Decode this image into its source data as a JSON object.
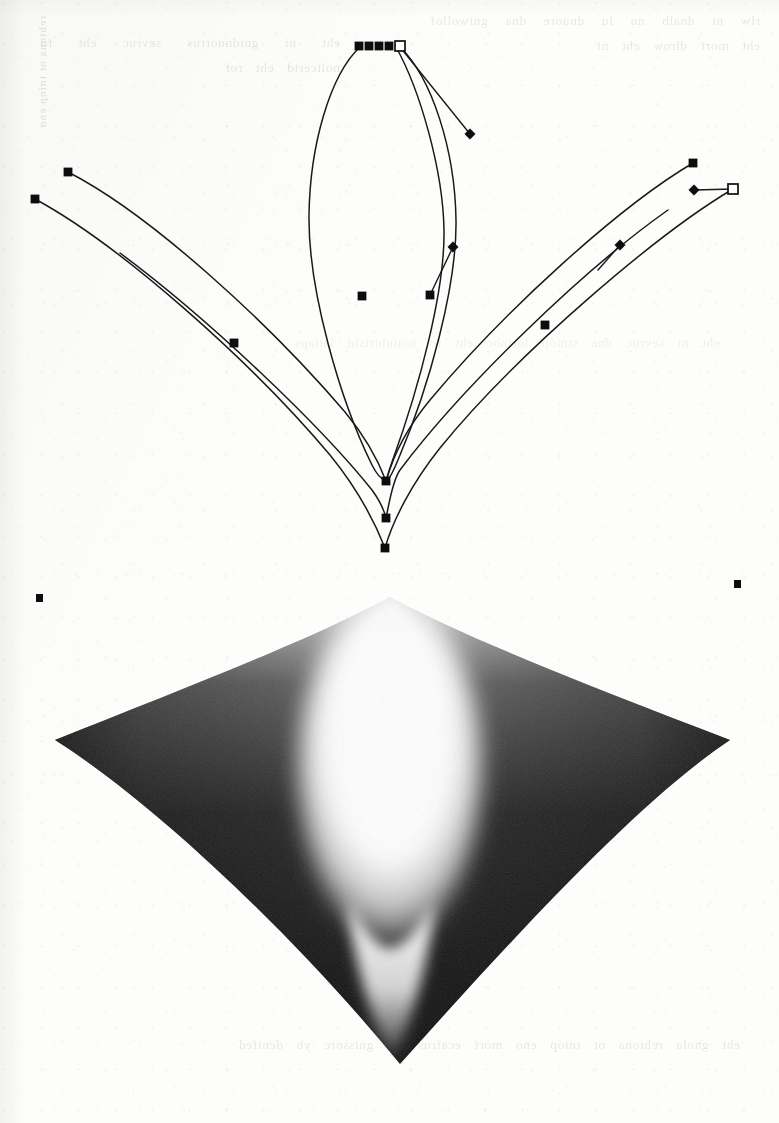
{
  "page": {
    "kind": "scanned-book-page",
    "width": 779,
    "height": 1123,
    "paper_color": "#fdfdfc",
    "ink_color": "#0d0d0d"
  },
  "ghost_text": {
    "note": "faint illegible bleed-through from the reverse side of the sheet",
    "top": "rlw ni dnalb nu lu dnuore dna gniwollof eht morf dlrow eht ni",
    "left": "eht ni gnidnuorrus sevruc eht fo noitcerid eht rof",
    "middle": "eht ni sevruc dna stniop lortnoc eht fo noitubirtsid laitaps",
    "bottom": "eht gnola rehtona ot tniop eno morf ecafrus eht gnissorc yb denifed"
  },
  "spine_text": "rehtona ot tniop eno",
  "curve_figure": {
    "name": "bezier-curve-control-diagram",
    "description": "Three branches of a cusp caustic drawn as outlined Bezier curves with visible anchor points, control nodes and tangent handles",
    "stroke_color": "#1a1a1a",
    "stroke_width": 1.5,
    "paths": [
      {
        "id": "left-outer",
        "d": "M 35 199 C 120 245 250 360 330 455 C 352 482 372 515 385 548"
      },
      {
        "id": "left-inner",
        "d": "M 68 172 C 150 214 268 322 345 412 C 364 435 378 460 386 481"
      },
      {
        "id": "center-left-lobe",
        "d": "M 360 47 C 330 75 310 145 309 215 C 308 290 340 400 372 465 C 378 477 383 480 386 481"
      },
      {
        "id": "center-right-lobe",
        "d": "M 400 47 C 432 78 455 150 456 220 C 457 285 430 385 398 460 C 393 472 389 479 387 481"
      },
      {
        "id": "center-inner-spike",
        "d": "M 396 47 C 420 90 443 170 444 230 C 445 290 420 385 392 462 C 389 471 387 478 386 481"
      },
      {
        "id": "right-inner",
        "d": "M 693 163 C 620 206 505 310 430 400 C 405 430 392 460 386 481"
      },
      {
        "id": "right-outer",
        "d": "M 733 189 C 660 232 520 350 440 448 C 412 483 393 520 385 548"
      },
      {
        "id": "middle-v-left",
        "d": "M 120 253 C 210 320 320 425 372 490 C 380 501 384 510 386 518"
      },
      {
        "id": "middle-v-right",
        "d": "M 668 210 C 580 272 460 390 400 470 C 392 481 388 510 386 518"
      }
    ],
    "handle_lines": [
      {
        "id": "top-right-handle",
        "x1": 400,
        "y1": 47,
        "x2": 470,
        "y2": 134
      },
      {
        "id": "mid-right-handle",
        "x1": 430,
        "y1": 295,
        "x2": 453,
        "y2": 247
      },
      {
        "id": "far-right-handle",
        "x1": 733,
        "y1": 189,
        "x2": 694,
        "y2": 190
      },
      {
        "id": "lower-right-handle",
        "x1": 598,
        "y1": 270,
        "x2": 620,
        "y2": 245
      }
    ],
    "nodes": [
      {
        "id": "anchor-top-1",
        "type": "filled-square",
        "x": 359,
        "y": 46
      },
      {
        "id": "anchor-top-2",
        "type": "filled-square",
        "x": 369,
        "y": 46
      },
      {
        "id": "anchor-top-3",
        "type": "filled-square",
        "x": 379,
        "y": 46
      },
      {
        "id": "anchor-top-4",
        "type": "filled-square",
        "x": 389,
        "y": 46
      },
      {
        "id": "anchor-top-selected",
        "type": "hollow-square",
        "x": 400,
        "y": 46
      },
      {
        "id": "handle-top-right",
        "type": "diamond",
        "x": 470,
        "y": 134
      },
      {
        "id": "anchor-left-upper",
        "type": "filled-square",
        "x": 68,
        "y": 172
      },
      {
        "id": "anchor-left-outer",
        "type": "filled-square",
        "x": 35,
        "y": 199
      },
      {
        "id": "anchor-left-mid",
        "type": "filled-square",
        "x": 234,
        "y": 343
      },
      {
        "id": "anchor-center-mid",
        "type": "filled-square",
        "x": 362,
        "y": 296
      },
      {
        "id": "anchor-center-right",
        "type": "filled-square",
        "x": 430,
        "y": 295
      },
      {
        "id": "handle-center-right",
        "type": "diamond",
        "x": 453,
        "y": 247
      },
      {
        "id": "anchor-right-upper",
        "type": "filled-square",
        "x": 693,
        "y": 163
      },
      {
        "id": "anchor-right-end",
        "type": "hollow-square",
        "x": 733,
        "y": 189
      },
      {
        "id": "handle-right-end",
        "type": "diamond",
        "x": 694,
        "y": 190
      },
      {
        "id": "handle-right-mid",
        "type": "diamond",
        "x": 620,
        "y": 245
      },
      {
        "id": "anchor-right-mid",
        "type": "filled-square",
        "x": 545,
        "y": 325
      },
      {
        "id": "cusp-node-upper",
        "type": "filled-square",
        "x": 386,
        "y": 481
      },
      {
        "id": "cusp-node-middle",
        "type": "filled-square",
        "x": 386,
        "y": 518
      },
      {
        "id": "cusp-node-lower",
        "type": "filled-square",
        "x": 385,
        "y": 548
      }
    ],
    "stray_dots": [
      {
        "id": "stray-dot-left",
        "x": 36,
        "y": 594,
        "w": 7,
        "h": 8
      },
      {
        "id": "stray-dot-right",
        "x": 734,
        "y": 580,
        "w": 7,
        "h": 8
      }
    ]
  },
  "gradient_figure": {
    "name": "cusp-caustic-intensity-plot",
    "description": "Kite-shaped region shaded with a grayscale intensity field: dark at the outer edges, a bright white caustic cusp running down the centre",
    "outline": "M 390 597 C 470 640 600 690 730 740 C 640 800 520 930 400 1064 C 290 930 150 800 55 740 C 185 688 315 638 390 597",
    "vertices": {
      "top": {
        "x": 390,
        "y": 597
      },
      "right": {
        "x": 730,
        "y": 740
      },
      "bottom": {
        "x": 400,
        "y": 1064
      },
      "left": {
        "x": 55,
        "y": 740
      }
    },
    "colors": {
      "darkest": "#111111",
      "mid": "#7a7a7a",
      "brightest": "#ffffff"
    },
    "caustic": {
      "left_branch": "M 390 600 C 350 700 318 820 352 940 C 368 1000 385 1040 398 1062",
      "right_branch": "M 390 600 C 432 700 466 820 432 940 C 416 1000 402 1040 398 1062"
    }
  }
}
